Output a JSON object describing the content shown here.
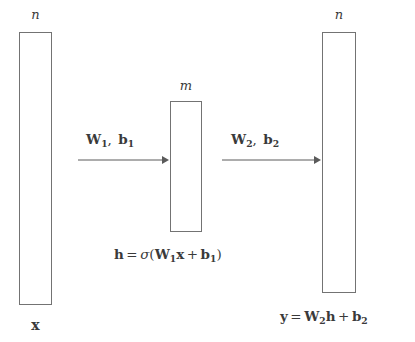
{
  "diagram": {
    "colors": {
      "background": "#ffffff",
      "stroke": "#737373",
      "text": "#3a3a3a"
    },
    "layers": [
      {
        "id": "input",
        "name": "input-vector",
        "dim_label": "n",
        "var_label": "x",
        "x": 19,
        "y": 32,
        "width": 33,
        "height": 273
      },
      {
        "id": "hidden",
        "name": "hidden-vector",
        "dim_label": "m",
        "var_label": "h",
        "x": 170,
        "y": 101,
        "width": 32,
        "height": 131
      },
      {
        "id": "output",
        "name": "output-vector",
        "dim_label": "n",
        "var_label": "y",
        "x": 322,
        "y": 32,
        "width": 34,
        "height": 261
      }
    ],
    "edges": [
      {
        "id": "edge1",
        "weight": "W",
        "weight_sub": "1",
        "bias": "b",
        "bias_sub": "1",
        "comma": ",",
        "x_start": 78,
        "x_end": 168,
        "y": 160
      },
      {
        "id": "edge2",
        "weight": "W",
        "weight_sub": "2",
        "bias": "b",
        "bias_sub": "2",
        "comma": ",",
        "x_start": 222,
        "x_end": 320,
        "y": 160
      }
    ],
    "equations": [
      {
        "id": "hidden-eq",
        "lhs": "h",
        "eq": "=",
        "sigma": "σ",
        "open": "(",
        "weight": "W",
        "weight_sub": "1",
        "input": "x",
        "plus": "+",
        "bias": "b",
        "bias_sub": "1",
        "close": ")"
      },
      {
        "id": "output-eq",
        "lhs": "y",
        "eq": "=",
        "weight": "W",
        "weight_sub": "2",
        "hidden": "h",
        "plus": "+",
        "bias": "b",
        "bias_sub": "2"
      }
    ]
  }
}
